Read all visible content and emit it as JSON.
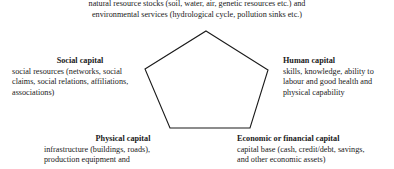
{
  "diagram": {
    "type": "pentagon-asset-framework",
    "shape": {
      "name": "pentagon",
      "stroke_color": "#1a1a1a",
      "fill_color": "#ffffff",
      "stroke_width": 1.1,
      "vertices": [
        [
          206,
          31
        ],
        [
          268,
          70
        ],
        [
          250,
          128
        ],
        [
          170,
          128
        ],
        [
          145,
          69
        ]
      ]
    },
    "blocks": [
      {
        "id": "natural-capital",
        "position": "top",
        "heading": "",
        "lines": [
          "natural resource stocks (soil, water, air, genetic resources etc.) and",
          "environmental services (hydrological cycle, pollution sinks etc.)"
        ]
      },
      {
        "id": "social-capital",
        "position": "left",
        "heading": "Social capital",
        "lines": [
          "social resources (networks, social",
          "claims, social relations, affiliations,",
          "associations)"
        ]
      },
      {
        "id": "human-capital",
        "position": "right",
        "heading": "Human capital",
        "lines": [
          "skills, knowledge, ability to",
          "labour and good health and",
          "physical capability"
        ]
      },
      {
        "id": "physical-capital",
        "position": "bottom-left",
        "heading": "Physical capital",
        "lines": [
          "infrastructure (buildings, roads),",
          "production equipment and"
        ]
      },
      {
        "id": "economic-capital",
        "position": "bottom-right",
        "heading": "Economic or financial capital",
        "lines": [
          "capital base (cash, credit/debt, savings,",
          "and other economic assets)"
        ]
      }
    ]
  }
}
